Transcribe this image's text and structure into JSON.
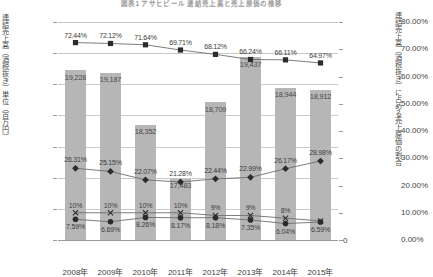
{
  "chart_data": {
    "type": "bar",
    "title": "図表1 アサヒビール 連結売上高と売上原価の推移",
    "categories": [
      "2008年",
      "2009年",
      "2010年",
      "2011年",
      "2012年",
      "2013年",
      "2014年",
      "2015年"
    ],
    "xlabel": "",
    "ylabel": "連結売上高（酒税抜き）単位（百万円）",
    "ylabel_right": "連結売上高（酒税抜き）に占める売上原価の割合",
    "ylim": [
      16500,
      20000
    ],
    "ylim_right": [
      0,
      80
    ],
    "ytick_labels": [
      "20,000",
      "19,500",
      "19,000",
      "18,500",
      "18,000",
      "17,500",
      "17,000",
      "16,500"
    ],
    "ytick_values": [
      20000,
      19500,
      19000,
      18500,
      18000,
      17500,
      17000,
      16500
    ],
    "ytick_labels_right": [
      "80.00%",
      "70.00%",
      "60.00%",
      "50.00%",
      "40.00%",
      "30.00%",
      "20.00%",
      "10.00%",
      "0.00%"
    ],
    "ytick_values_right": [
      80,
      70,
      60,
      50,
      40,
      30,
      20,
      10,
      0
    ],
    "zero_label": "0",
    "grid": true,
    "legend_position": "none",
    "bar_series": {
      "name": "連結売上高（酒税抜き）",
      "axis": "left",
      "color": "#b6b6b6",
      "values": [
        19228,
        19187,
        18352,
        17483,
        18709,
        19437,
        18944,
        18912
      ],
      "labels": [
        "19,228",
        "19,187",
        "18,352",
        "17,483",
        "18,709",
        "19,437",
        "18,944",
        "18,912"
      ]
    },
    "series": [
      {
        "name": "売上原価率",
        "marker": "square",
        "axis": "right",
        "color": "#2b2b2b",
        "values": [
          72.44,
          72.12,
          71.64,
          69.71,
          68.12,
          66.24,
          66.11,
          64.97
        ],
        "labels": [
          "72.44%",
          "72.12%",
          "71.64%",
          "69.71%",
          "68.12%",
          "66.24%",
          "66.11%",
          "64.97%"
        ]
      },
      {
        "name": "販管費率",
        "marker": "diamond",
        "axis": "right",
        "color": "#2b2b2b",
        "values": [
          26.31,
          25.15,
          22.07,
          21.28,
          22.44,
          22.99,
          26.17,
          28.98
        ],
        "labels": [
          "26.31%",
          "25.15%",
          "22.07%",
          "21.28%",
          "22.44%",
          "22.99%",
          "26.17%",
          "28.98%"
        ]
      },
      {
        "name": "営業利益率",
        "marker": "cross",
        "axis": "right",
        "color": "#2b2b2b",
        "values": [
          10,
          10,
          10,
          10,
          9,
          9,
          8,
          7
        ],
        "labels": [
          "10%",
          "10%",
          "10%",
          "10%",
          "9%",
          "9%",
          "8%",
          ""
        ]
      },
      {
        "name": "当期純利益率",
        "marker": "circle",
        "axis": "right",
        "color": "#2b2b2b",
        "values": [
          7.59,
          6.69,
          8.26,
          8.17,
          8.18,
          7.35,
          6.04,
          6.59
        ],
        "labels": [
          "7.59%",
          "6.69%",
          "8.26%",
          "8.17%",
          "8.18%",
          "7.35%",
          "6.04%",
          "6.59%"
        ]
      }
    ]
  }
}
